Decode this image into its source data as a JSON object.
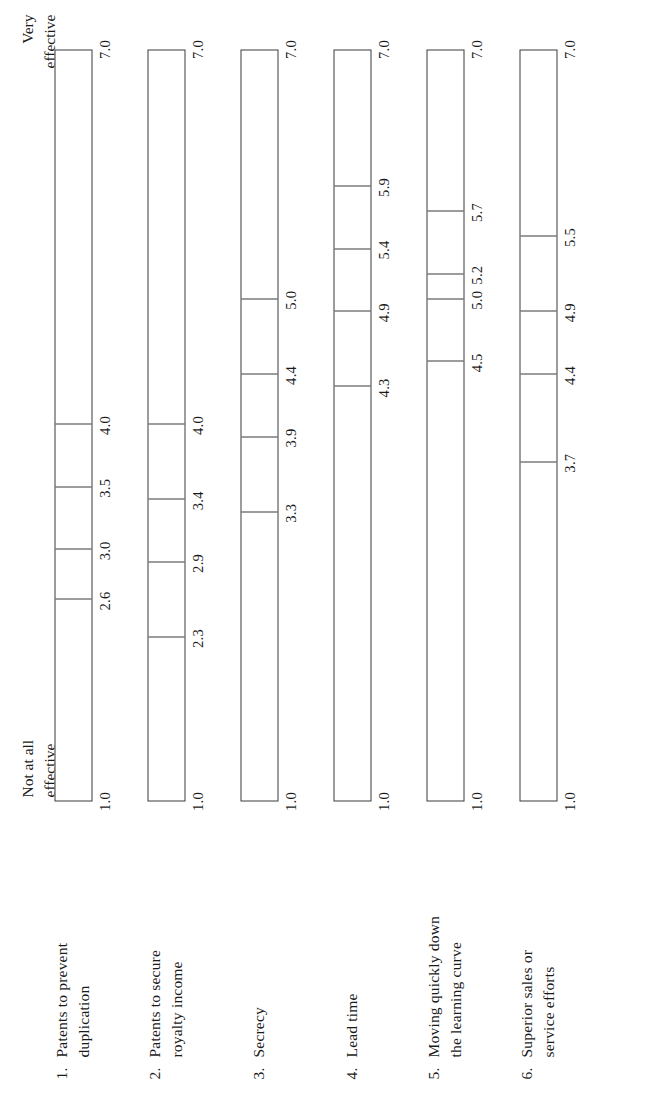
{
  "figure": {
    "scale_low_label": "Not at all\neffective",
    "scale_high_label": "Very\neffective",
    "axis_min_label": "1.0",
    "axis_max_label": "7.0",
    "line_color": "#3a3a3a",
    "text_color": "#1a1a1a",
    "background": "#ffffff"
  },
  "chart_data": {
    "type": "bar",
    "title": "",
    "subtitle": "",
    "xlabel": "",
    "ylabel": "",
    "xlim": [
      1.0,
      7.0
    ],
    "grid": false,
    "legend": "none",
    "orientation": "horizontal-rotated-90ccw",
    "axis_anchor_low": "Not at all effective",
    "axis_anchor_high": "Very effective",
    "axis_tick_labels": [
      "1.0",
      "7.0"
    ],
    "note": "Each category is a 1.0-7.0 scale bar with internal tick marks marking group mean ratings.",
    "categories": [
      {
        "number": "1.",
        "label": "Patents to prevent\nduplication",
        "plain_label": "Patents to prevent duplication",
        "axis_min_label": "1.0",
        "axis_max_label": "7.0",
        "marks": [
          {
            "value": 2.6,
            "label": "2.6"
          },
          {
            "value": 3.0,
            "label": "3.0"
          },
          {
            "value": 3.5,
            "label": "3.5"
          },
          {
            "value": 4.0,
            "label": "4.0"
          }
        ]
      },
      {
        "number": "2.",
        "label": "Patents to secure\nroyalty income",
        "plain_label": "Patents to secure royalty income",
        "axis_min_label": "1.0",
        "axis_max_label": "7.0",
        "marks": [
          {
            "value": 2.3,
            "label": "2.3"
          },
          {
            "value": 2.9,
            "label": "2.9"
          },
          {
            "value": 3.4,
            "label": "3.4"
          },
          {
            "value": 4.0,
            "label": "4.0"
          }
        ]
      },
      {
        "number": "3.",
        "label": "Secrecy",
        "plain_label": "Secrecy",
        "axis_min_label": "1.0",
        "axis_max_label": "7.0",
        "marks": [
          {
            "value": 3.3,
            "label": "3.3"
          },
          {
            "value": 3.9,
            "label": "3.9"
          },
          {
            "value": 4.4,
            "label": "4.4"
          },
          {
            "value": 5.0,
            "label": "5.0"
          }
        ]
      },
      {
        "number": "4.",
        "label": "Lead time",
        "plain_label": "Lead time",
        "axis_min_label": "1.0",
        "axis_max_label": "7.0",
        "marks": [
          {
            "value": 4.3,
            "label": "4.3"
          },
          {
            "value": 4.9,
            "label": "4.9"
          },
          {
            "value": 5.4,
            "label": "5.4"
          },
          {
            "value": 5.9,
            "label": "5.9"
          }
        ]
      },
      {
        "number": "5.",
        "label": "Moving quickly down\nthe learning curve",
        "plain_label": "Moving quickly down the learning curve",
        "axis_min_label": "1.0",
        "axis_max_label": "7.0",
        "marks": [
          {
            "value": 4.5,
            "label": "4.5"
          },
          {
            "value": 5.0,
            "label": "5.0"
          },
          {
            "value": 5.2,
            "label": "5.2"
          },
          {
            "value": 5.7,
            "label": "5.7"
          }
        ]
      },
      {
        "number": "6.",
        "label": "Superior sales or\nservice efforts",
        "plain_label": "Superior sales or service efforts",
        "axis_min_label": "1.0",
        "axis_max_label": "7.0",
        "marks": [
          {
            "value": 3.7,
            "label": "3.7"
          },
          {
            "value": 4.4,
            "label": "4.4"
          },
          {
            "value": 4.9,
            "label": "4.9"
          },
          {
            "value": 5.5,
            "label": "5.5"
          }
        ]
      }
    ]
  }
}
